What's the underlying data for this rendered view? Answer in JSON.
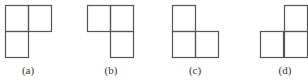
{
  "figures": [
    {
      "label": "(a)",
      "cells": [
        [
          5,
          5
        ],
        [
          28,
          5
        ],
        [
          5,
          31
        ]
      ],
      "label_x": 28
    },
    {
      "label": "(b)",
      "cells": [
        [
          87,
          5
        ],
        [
          110,
          5
        ],
        [
          110,
          31
        ]
      ],
      "label_x": 111
    },
    {
      "label": "(c)",
      "cells": [
        [
          172,
          5
        ],
        [
          172,
          31
        ],
        [
          195,
          31
        ]
      ],
      "label_x": 195
    },
    {
      "label": "(d)",
      "cells": [
        [
          284,
          5
        ],
        [
          260,
          31
        ],
        [
          284,
          31
        ]
      ],
      "label_x": 285
    }
  ],
  "cell_width": 23,
  "cell_height": 26,
  "label_y": 74,
  "stroke_color": "#555555"
}
